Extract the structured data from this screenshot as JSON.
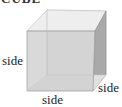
{
  "title": "CUBE",
  "diagram": {
    "shape": "cube",
    "labels": {
      "left": "side",
      "bottom": "side",
      "right": "side"
    },
    "colors": {
      "front_face": "#d4d4d4",
      "right_face": "#a8a8a8",
      "top_face": "#ececec",
      "back_face": "#e4e4e4",
      "edge": "#9a9a9a"
    }
  }
}
